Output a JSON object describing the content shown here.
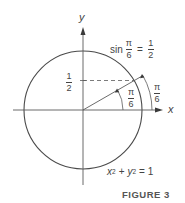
{
  "figure": {
    "caption": "FIGURE 3",
    "axes": {
      "x_label": "x",
      "y_label": "y"
    },
    "circle_equation": {
      "x": "x",
      "y": "y",
      "exp": "2",
      "plus": "+",
      "equals": "= 1"
    },
    "sin_label": {
      "fn": "sin",
      "num": "π",
      "den": "6",
      "equals": "=",
      "rhs_num": "1",
      "rhs_den": "2"
    },
    "y_tick": {
      "num": "1",
      "den": "2"
    },
    "inner_angle": {
      "num": "π",
      "den": "6"
    },
    "outer_angle": {
      "num": "π",
      "den": "6"
    },
    "colors": {
      "stroke": "#4a4a4a",
      "text": "#444444"
    }
  }
}
